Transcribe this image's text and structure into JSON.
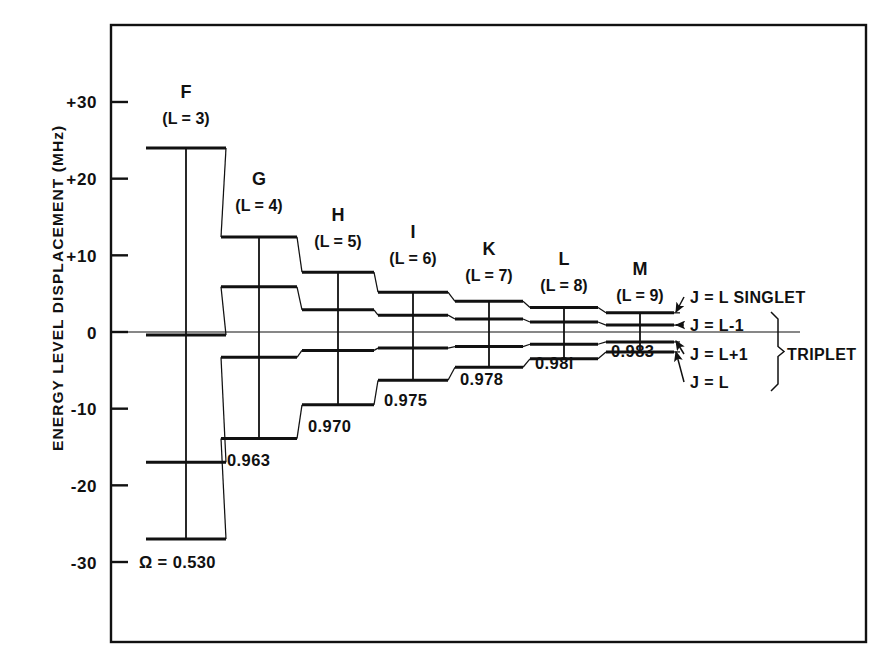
{
  "figure": {
    "y_axis_title": "ENERGY  LEVEL  DISPLACEMENT  (MHz)",
    "frame": {
      "left": 111,
      "right": 866,
      "top": 25,
      "bottom": 642
    }
  },
  "chart_data": {
    "type": "diagram",
    "title": "",
    "xlabel": "",
    "ylabel": "ENERGY LEVEL DISPLACEMENT (MHz)",
    "ylim": [
      -33,
      38
    ],
    "yticks": [
      30,
      20,
      10,
      0,
      -10,
      -20,
      -30
    ],
    "ytick_labels": [
      "+30",
      "+20",
      "+10",
      "0",
      "-10",
      "-20",
      "-30"
    ],
    "grid": false,
    "zero_line": true,
    "px_per_mhz": 7.667,
    "zero_y_px": 332,
    "series_labels": [
      "J = L  SINGLET",
      "J = L-1",
      "J = L+1",
      "J = L"
    ],
    "columns": [
      {
        "letter": "F",
        "sub": "(L = 3)",
        "x_px": 186,
        "half_width_px": 40,
        "omega": "Ω = 0.530",
        "omega_x_px": 139,
        "omega_y_px": 568,
        "letter_y_px": 98,
        "sub_y_px": 124,
        "levels": [
          24.0,
          -0.4,
          -17.0,
          -27.0
        ]
      },
      {
        "letter": "G",
        "sub": "(L = 4)",
        "x_px": 259,
        "half_width_px": 38,
        "omega": "0.963",
        "omega_x_px": 227,
        "omega_y_px": 466,
        "letter_y_px": 185,
        "sub_y_px": 211,
        "levels": [
          12.4,
          5.9,
          -3.3,
          -13.9
        ]
      },
      {
        "letter": "H",
        "sub": "(L = 5)",
        "x_px": 338,
        "half_width_px": 36,
        "omega": "0.970",
        "omega_x_px": 308,
        "omega_y_px": 432,
        "letter_y_px": 221,
        "sub_y_px": 247,
        "levels": [
          7.8,
          2.9,
          -2.4,
          -9.5
        ]
      },
      {
        "letter": "I",
        "sub": "(L = 6)",
        "x_px": 413,
        "half_width_px": 35,
        "omega": "0.975",
        "omega_x_px": 384,
        "omega_y_px": 406,
        "letter_y_px": 238,
        "sub_y_px": 264,
        "levels": [
          5.2,
          2.2,
          -2.1,
          -6.3
        ]
      },
      {
        "letter": "K",
        "sub": "(L = 7)",
        "x_px": 489,
        "half_width_px": 34,
        "omega": "0.978",
        "omega_x_px": 460,
        "omega_y_px": 385,
        "letter_y_px": 255,
        "sub_y_px": 281,
        "levels": [
          4.0,
          1.7,
          -1.9,
          -4.6
        ]
      },
      {
        "letter": "L",
        "sub": "(L = 8)",
        "x_px": 564,
        "half_width_px": 34,
        "omega": "0.98l",
        "omega_x_px": 535,
        "omega_y_px": 369,
        "letter_y_px": 265,
        "sub_y_px": 291,
        "levels": [
          3.2,
          1.3,
          -1.6,
          -3.5
        ]
      },
      {
        "letter": "M",
        "sub": "(L = 9)",
        "x_px": 640,
        "half_width_px": 34,
        "omega": "0.983",
        "omega_x_px": 611,
        "omega_y_px": 357,
        "letter_y_px": 275,
        "sub_y_px": 301,
        "levels": [
          2.5,
          0.9,
          -1.3,
          -2.6
        ]
      }
    ],
    "annotations": [
      {
        "text": "J = L  SINGLET",
        "x_px": 690,
        "y_px": 297,
        "arrow_to_x": 676,
        "arrow_to_y": 312
      },
      {
        "text": "J = L-1",
        "x_px": 690,
        "y_px": 325,
        "arrow_to_x": 676,
        "arrow_to_y": 325
      },
      {
        "text": "J = L+1",
        "x_px": 690,
        "y_px": 354,
        "arrow_to_x": 676,
        "arrow_to_y": 341
      },
      {
        "text": "J = L",
        "x_px": 690,
        "y_px": 382,
        "arrow_to_x": 676,
        "arrow_to_y": 352
      }
    ],
    "bracket_label": "TRIPLET"
  }
}
